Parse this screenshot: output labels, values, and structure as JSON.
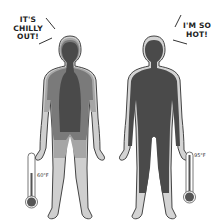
{
  "figures": [
    {
      "id": "cold-figure",
      "speech": [
        "IT'S",
        "CHILLY",
        "OUT!"
      ],
      "thermometer_label": "60°F",
      "colors": {
        "core": "#4a4a4a",
        "mid": "#7a7a7a",
        "outer": "#a6a6a6",
        "extremity": "#cfcfcf"
      }
    },
    {
      "id": "hot-figure",
      "speech": [
        "I'M SO",
        "HOT!"
      ],
      "thermometer_label": "95°F",
      "colors": {
        "core": "#4a4a4a",
        "extremity": "#d4d4d4"
      }
    }
  ]
}
